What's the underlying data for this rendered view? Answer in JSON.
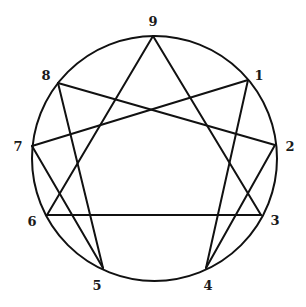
{
  "diagram": {
    "type": "enneagram",
    "circle": {
      "cx": 154.5,
      "cy": 158.5,
      "r": 122.5,
      "stroke": "#111111"
    },
    "points": [
      {
        "id": "9",
        "label": "9",
        "x": 153,
        "y": 36,
        "lx": 153,
        "ly": 21
      },
      {
        "id": "1",
        "label": "1",
        "x": 248,
        "y": 80,
        "lx": 259,
        "ly": 75
      },
      {
        "id": "2",
        "label": "2",
        "x": 275,
        "y": 145,
        "lx": 290,
        "ly": 146
      },
      {
        "id": "3",
        "label": "3",
        "x": 261,
        "y": 215,
        "lx": 275,
        "ly": 220
      },
      {
        "id": "4",
        "label": "4",
        "x": 206,
        "y": 268,
        "lx": 208,
        "ly": 285
      },
      {
        "id": "5",
        "label": "5",
        "x": 103,
        "y": 268,
        "lx": 97,
        "ly": 285
      },
      {
        "id": "6",
        "label": "6",
        "x": 47,
        "y": 215,
        "lx": 32,
        "ly": 221
      },
      {
        "id": "7",
        "label": "7",
        "x": 32,
        "y": 146,
        "lx": 18,
        "ly": 146
      },
      {
        "id": "8",
        "label": "8",
        "x": 58,
        "y": 83,
        "lx": 46,
        "ly": 75
      }
    ],
    "edges": [
      [
        "9",
        "3"
      ],
      [
        "3",
        "6"
      ],
      [
        "6",
        "9"
      ],
      [
        "1",
        "4"
      ],
      [
        "4",
        "2"
      ],
      [
        "2",
        "8"
      ],
      [
        "8",
        "5"
      ],
      [
        "5",
        "7"
      ],
      [
        "7",
        "1"
      ]
    ]
  }
}
